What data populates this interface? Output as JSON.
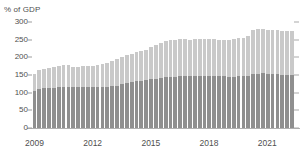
{
  "chart_data": {
    "type": "bar",
    "title": "",
    "subtitle": "",
    "xlabel": "",
    "ylabel": "% of GDP",
    "ylim": [
      0,
      300
    ],
    "ytick_values": [
      0,
      50,
      100,
      150,
      200,
      250,
      300
    ],
    "ytick_labels": [
      "0",
      "50",
      "100",
      "150",
      "200",
      "250",
      "300"
    ],
    "xtick_labels": [
      "2009",
      "2012",
      "2015",
      "2018",
      "2021"
    ],
    "xtick_positions": [
      0,
      12,
      24,
      36,
      48
    ],
    "grid": false,
    "legend": "none",
    "stacked": true,
    "bar_color_lower": "#8f8f8f",
    "bar_color_upper": "#c9c9c9",
    "axis_color": "#b0b0b0",
    "text_color": "#4f4f4f",
    "series": [
      {
        "name": "lower",
        "values": [
          104,
          110,
          112,
          113,
          114,
          115,
          116,
          117,
          116,
          116,
          117,
          117,
          116,
          115,
          116,
          117,
          118,
          120,
          124,
          128,
          130,
          132,
          134,
          136,
          138,
          140,
          142,
          143,
          144,
          145,
          146,
          146,
          146,
          147,
          147,
          147,
          146,
          146,
          146,
          146,
          145,
          145,
          146,
          147,
          148,
          152,
          154,
          155,
          154,
          153,
          152,
          151,
          150,
          150
        ]
      },
      {
        "name": "upper",
        "values": [
          49,
          53,
          55,
          56,
          58,
          60,
          61,
          60,
          58,
          58,
          58,
          59,
          60,
          62,
          65,
          68,
          71,
          74,
          76,
          78,
          80,
          82,
          84,
          86,
          90,
          95,
          100,
          102,
          104,
          105,
          105,
          105,
          104,
          104,
          104,
          105,
          106,
          106,
          104,
          103,
          104,
          106,
          108,
          109,
          112,
          124,
          126,
          125,
          124,
          125,
          126,
          125,
          125,
          125
        ]
      }
    ],
    "totals": [
      153,
      163,
      167,
      169,
      172,
      175,
      177,
      177,
      174,
      174,
      175,
      176,
      176,
      177,
      181,
      185,
      189,
      194,
      200,
      206,
      210,
      214,
      218,
      222,
      228,
      235,
      242,
      245,
      248,
      250,
      251,
      251,
      250,
      251,
      251,
      252,
      252,
      252,
      250,
      249,
      249,
      251,
      254,
      256,
      260,
      276,
      280,
      280,
      278,
      278,
      278,
      276,
      275,
      275
    ]
  }
}
